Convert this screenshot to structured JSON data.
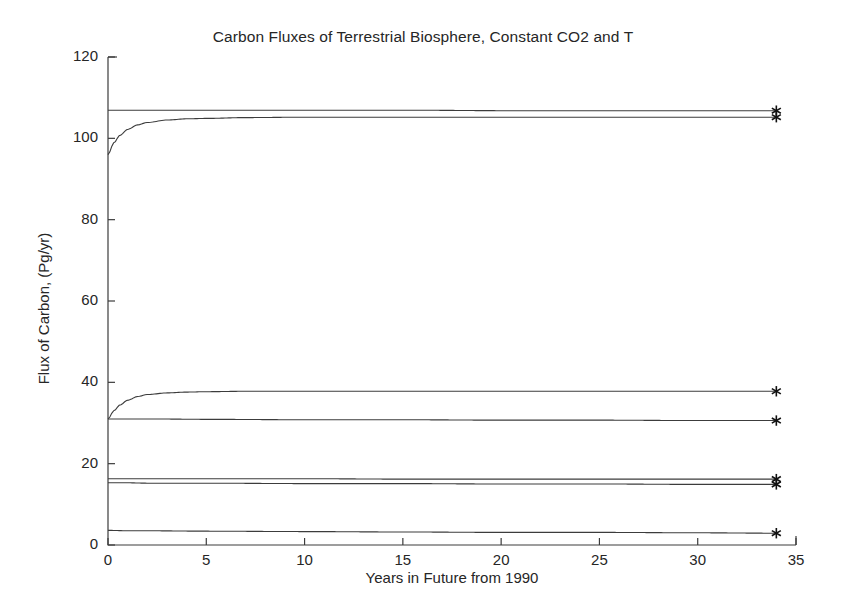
{
  "chart_data": {
    "type": "line",
    "title": "Carbon Fluxes of Terrestrial Biosphere, Constant CO2 and T",
    "xlabel": "Years in Future from 1990",
    "ylabel": "Flux of Carbon, (Pg/yr)",
    "xlim": [
      0,
      35
    ],
    "ylim": [
      0,
      120
    ],
    "xticks": [
      0,
      5,
      10,
      15,
      20,
      25,
      30,
      35
    ],
    "yticks": [
      0,
      20,
      40,
      60,
      80,
      100,
      120
    ],
    "grid": false,
    "legend": "none",
    "line_color": "#3c3c3c",
    "marker": "asterisk",
    "marker_x": 34,
    "series": [
      {
        "name": "series-1-upper-flat",
        "marker_value": 106.8,
        "x": [
          0,
          0.5,
          1,
          2,
          3,
          5,
          8,
          12,
          16,
          20,
          25,
          30,
          34
        ],
        "values": [
          106.9,
          106.9,
          106.9,
          106.9,
          106.9,
          106.9,
          106.9,
          106.9,
          106.9,
          106.8,
          106.8,
          106.8,
          106.8
        ]
      },
      {
        "name": "series-2-upper-rising",
        "marker_value": 105.2,
        "x": [
          0,
          0.3,
          0.6,
          1,
          1.5,
          2,
          3,
          4,
          5,
          7,
          10,
          14,
          18,
          22,
          26,
          30,
          34
        ],
        "values": [
          96.0,
          98.9,
          100.7,
          102.2,
          103.3,
          103.9,
          104.5,
          104.8,
          104.9,
          105.1,
          105.2,
          105.2,
          105.2,
          105.2,
          105.2,
          105.2,
          105.2
        ]
      },
      {
        "name": "series-3-mid-rising",
        "marker_value": 37.8,
        "x": [
          0,
          0.3,
          0.6,
          1,
          1.5,
          2,
          3,
          4,
          5,
          7,
          10,
          14,
          18,
          22,
          26,
          30,
          34
        ],
        "values": [
          31.0,
          33.0,
          34.4,
          35.6,
          36.5,
          37.0,
          37.4,
          37.6,
          37.7,
          37.8,
          37.8,
          37.8,
          37.8,
          37.8,
          37.8,
          37.8,
          37.8
        ]
      },
      {
        "name": "series-4-mid-flat",
        "marker_value": 30.6,
        "x": [
          0,
          1,
          2,
          5,
          10,
          15,
          20,
          25,
          30,
          34
        ],
        "values": [
          31.0,
          31.0,
          31.0,
          30.9,
          30.8,
          30.8,
          30.7,
          30.7,
          30.6,
          30.6
        ]
      },
      {
        "name": "series-5-low-upper",
        "marker_value": 16.2,
        "x": [
          0,
          1,
          2,
          5,
          10,
          15,
          20,
          25,
          30,
          34
        ],
        "values": [
          16.3,
          16.3,
          16.3,
          16.3,
          16.3,
          16.2,
          16.2,
          16.2,
          16.2,
          16.2
        ]
      },
      {
        "name": "series-6-low-lower",
        "marker_value": 14.9,
        "x": [
          0,
          1,
          2,
          5,
          10,
          15,
          20,
          25,
          30,
          34
        ],
        "values": [
          15.3,
          15.3,
          15.2,
          15.2,
          15.1,
          15.1,
          15.0,
          15.0,
          14.9,
          14.9
        ]
      },
      {
        "name": "series-7-bottom",
        "marker_value": 2.9,
        "x": [
          0,
          1,
          2,
          5,
          10,
          15,
          20,
          25,
          30,
          34
        ],
        "values": [
          3.6,
          3.5,
          3.5,
          3.4,
          3.3,
          3.2,
          3.1,
          3.1,
          3.0,
          2.9
        ]
      }
    ]
  }
}
